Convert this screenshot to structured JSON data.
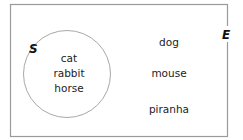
{
  "diagram": {
    "type": "venn",
    "universal_set": {
      "label": "E",
      "elements": [
        "dog",
        "mouse",
        "piranha"
      ]
    },
    "subset": {
      "label": "S",
      "elements": [
        "cat",
        "rabbit",
        "horse"
      ]
    },
    "colors": {
      "border": "#9a9a9a",
      "circle": "#a8a8a8",
      "text": "#222222"
    }
  }
}
